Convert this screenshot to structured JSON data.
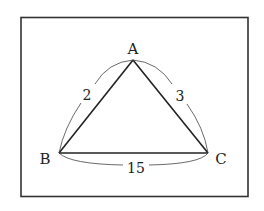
{
  "diagram": {
    "type": "triangle",
    "vertices": [
      {
        "id": "A",
        "label": "A"
      },
      {
        "id": "B",
        "label": "B"
      },
      {
        "id": "C",
        "label": "C"
      }
    ],
    "edges": [
      {
        "from": "A",
        "to": "B",
        "label": "2"
      },
      {
        "from": "A",
        "to": "C",
        "label": "3"
      },
      {
        "from": "B",
        "to": "C",
        "label": "15"
      }
    ],
    "colors": {
      "stroke": "#222222",
      "frame": "#333333",
      "background": "#ffffff"
    }
  }
}
